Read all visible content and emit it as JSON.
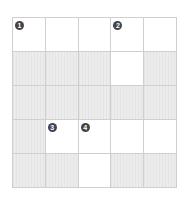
{
  "puzzle": {
    "rows": 5,
    "cols": 5,
    "colors": {
      "open": "#ffffff",
      "blocked": "#ececec",
      "grid_line": "#cfcfcf",
      "number_badge": "#444444"
    },
    "cells": [
      [
        {
          "type": "open",
          "number": "1"
        },
        {
          "type": "open",
          "number": ""
        },
        {
          "type": "open",
          "number": ""
        },
        {
          "type": "open",
          "number": "2"
        },
        {
          "type": "open",
          "number": ""
        }
      ],
      [
        {
          "type": "blocked",
          "number": ""
        },
        {
          "type": "blocked",
          "number": ""
        },
        {
          "type": "blocked",
          "number": ""
        },
        {
          "type": "open",
          "number": ""
        },
        {
          "type": "blocked",
          "number": ""
        }
      ],
      [
        {
          "type": "blocked",
          "number": ""
        },
        {
          "type": "blocked",
          "number": ""
        },
        {
          "type": "blocked",
          "number": ""
        },
        {
          "type": "blocked",
          "number": ""
        },
        {
          "type": "blocked",
          "number": ""
        }
      ],
      [
        {
          "type": "blocked",
          "number": ""
        },
        {
          "type": "open",
          "number": "3"
        },
        {
          "type": "open",
          "number": "4"
        },
        {
          "type": "open",
          "number": ""
        },
        {
          "type": "open",
          "number": ""
        }
      ],
      [
        {
          "type": "blocked",
          "number": ""
        },
        {
          "type": "blocked",
          "number": ""
        },
        {
          "type": "open",
          "number": ""
        },
        {
          "type": "blocked",
          "number": ""
        },
        {
          "type": "blocked",
          "number": ""
        }
      ]
    ]
  }
}
